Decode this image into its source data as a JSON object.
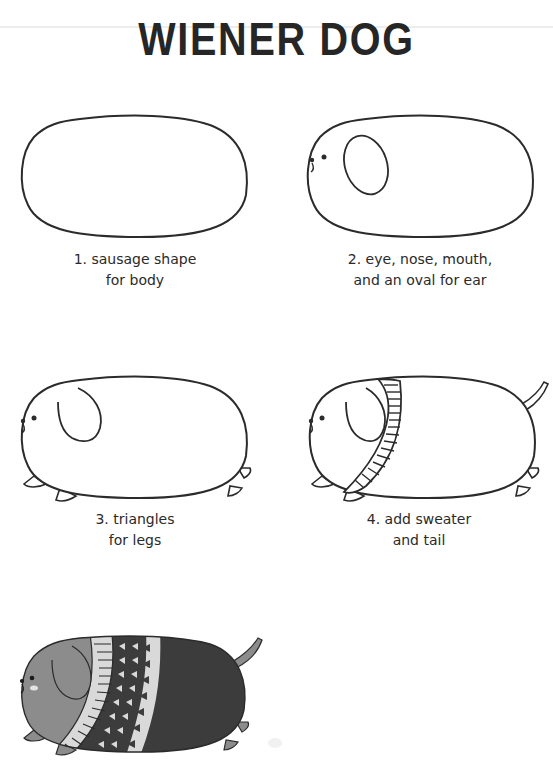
{
  "page": {
    "title": "WIENER DOG"
  },
  "steps": [
    {
      "number": "1",
      "caption_line1": "1. sausage shape",
      "caption_line2": "for body",
      "drawing": "outline-body"
    },
    {
      "number": "2",
      "caption_line1": "2. eye, nose, mouth,",
      "caption_line2": "and an oval for ear",
      "drawing": "body-face-ear"
    },
    {
      "number": "3",
      "caption_line1": "3. triangles",
      "caption_line2": "for legs",
      "drawing": "body-face-ear-legs"
    },
    {
      "number": "4",
      "caption_line1": "4. add sweater",
      "caption_line2": "and tail",
      "drawing": "body-sweater-tail"
    },
    {
      "number": "5",
      "caption_line1": "",
      "caption_line2": "",
      "drawing": "finished-colored-dog"
    }
  ],
  "colors": {
    "ink": "#2b2b2b",
    "dog_body_gray": "#8c8c8c",
    "sweater_dark": "#3c3c3c",
    "sweater_light": "#d9d9d9",
    "cheek": "#e3e3e3",
    "paper": "#ffffff"
  }
}
